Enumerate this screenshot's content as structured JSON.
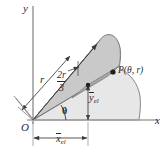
{
  "figure": {
    "axes": {
      "y_label": "y",
      "x_label": "x",
      "origin_label": "O"
    },
    "labels": {
      "radius": "r",
      "angle": "θ",
      "point": "P(θ, r)",
      "centroid_fraction_numerator": "2r",
      "centroid_fraction_denominator": "3",
      "y_centroid_symbol": "y",
      "y_centroid_subscript": "el",
      "x_centroid_symbol": "x",
      "x_centroid_subscript": "el"
    },
    "colors": {
      "area_light": "#e6e6e6",
      "sector_mid": "#c9c9c9",
      "strip_dark": "#a8a8a8",
      "outline": "#6e6e6e",
      "axis": "#9a9a9a",
      "ink": "#2b2b2b"
    },
    "geometry": {
      "origin": [
        33,
        120
      ],
      "point_P": [
        113,
        72
      ],
      "sector_tip": [
        100,
        40
      ],
      "theta_degrees": 31,
      "centroid_marker": [
        88,
        85
      ]
    }
  }
}
